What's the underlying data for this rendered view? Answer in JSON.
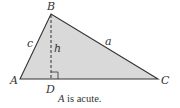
{
  "diagram": {
    "type": "triangle-with-altitude",
    "colors": {
      "fill": "#d9d9d9",
      "stroke": "#333333",
      "text": "#333333"
    },
    "vertices": {
      "A": {
        "label": "A",
        "x": 20,
        "y": 79
      },
      "B": {
        "label": "B",
        "x": 51,
        "y": 14
      },
      "C": {
        "label": "C",
        "x": 158,
        "y": 79
      },
      "D": {
        "label": "D",
        "x": 51,
        "y": 79
      }
    },
    "sides": {
      "c": {
        "label": "c"
      },
      "a": {
        "label": "a"
      },
      "h": {
        "label": "h"
      }
    },
    "caption": {
      "italic_part": "A",
      "rest": " is acute."
    }
  }
}
